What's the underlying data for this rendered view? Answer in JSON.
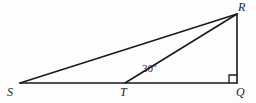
{
  "figure": {
    "background_color": "#fdfdfd",
    "stroke_color": "#1a1a1a",
    "stroke_width": 1.6,
    "width": 256,
    "height": 103
  },
  "points": {
    "S": {
      "label": "S",
      "x": 20,
      "y": 83
    },
    "T": {
      "label": "T",
      "x": 125,
      "y": 83
    },
    "Q": {
      "label": "Q",
      "x": 237,
      "y": 83
    },
    "R": {
      "label": "R",
      "x": 237,
      "y": 14
    }
  },
  "segments": [
    {
      "name": "segment-SQ",
      "from": "S",
      "to": "Q"
    },
    {
      "name": "segment-SR",
      "from": "S",
      "to": "R"
    },
    {
      "name": "segment-TR",
      "from": "T",
      "to": "R"
    },
    {
      "name": "segment-RQ",
      "from": "R",
      "to": "Q"
    }
  ],
  "angles": {
    "RTQ": {
      "value": "30",
      "degree_symbol": "o",
      "text": "30",
      "x": 142,
      "y": 62
    },
    "RQS": {
      "marker": "right-angle",
      "size": 8
    }
  }
}
